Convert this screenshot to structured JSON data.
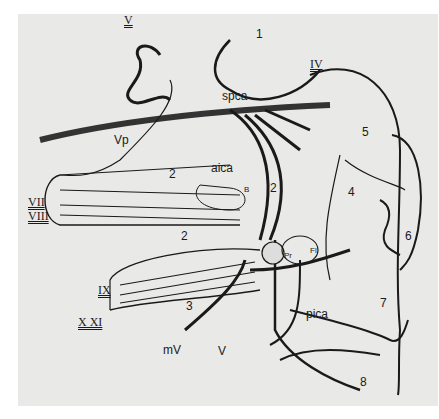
{
  "labels": {
    "n1": "1",
    "n2a": "2",
    "n2b": "2",
    "n2c": "2",
    "n3": "3",
    "n4": "4",
    "n5": "5",
    "n6": "6",
    "n7": "7",
    "n8": "8",
    "V_top": "V",
    "IV": "IV",
    "spca": "spca",
    "Vp": "Vp",
    "aica": "aica",
    "B": "B",
    "VII": "VII",
    "VIII": "VIII",
    "IX": "IX",
    "XXI": "X XI",
    "mV": "mV",
    "V_bottom": "V",
    "Pr": "Pr",
    "Fl": "Fl",
    "pica": "pica"
  },
  "colors": {
    "background": "#e9e9e7",
    "ink": "#1a1a1a",
    "vessel": "#333333"
  }
}
